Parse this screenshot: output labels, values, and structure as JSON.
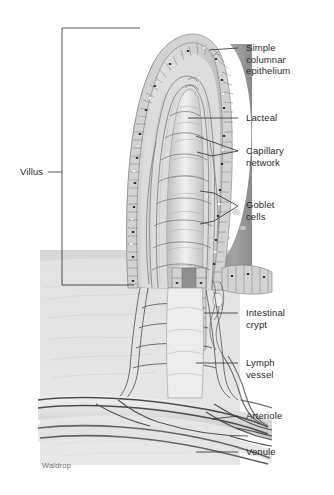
{
  "figure": {
    "signature": "Waldrop",
    "background_color": "#ffffff",
    "line_color": "#2b2b2b",
    "text_color": "#2b2b2b"
  },
  "palette": {
    "epithelium_light": "#d9d9d9",
    "epithelium_mid": "#bcbcbc",
    "lumen_gray": "#9a9a9a",
    "lamina_propria": "#cfcfcf",
    "goblet_dark": "#2a2a2a",
    "lacteal_white": "#f2f2f2",
    "vessel_dark": "#555555",
    "submucosa": "#dedede",
    "outline": "#4a4a4a"
  },
  "labels": [
    {
      "id": "villus",
      "text": "Villus",
      "x": 20,
      "y": 171,
      "leader": "bracket-left"
    },
    {
      "id": "simple-columnar-epithelium",
      "text": "Simple\ncolumnar\nepithelium",
      "x": 246,
      "y": 42,
      "leader": "line-right"
    },
    {
      "id": "lacteal",
      "text": "Lacteal",
      "x": 246,
      "y": 112,
      "leader": "line-right"
    },
    {
      "id": "capillary-network",
      "text": "Capillary\nnetwork",
      "x": 246,
      "y": 139,
      "leader": "line-right-forked"
    },
    {
      "id": "goblet-cells",
      "text": "Goblet\ncells",
      "x": 246,
      "y": 194,
      "leader": "line-right-forked"
    },
    {
      "id": "intestinal-crypt",
      "text": "Intestinal\ncrypt",
      "x": 246,
      "y": 307,
      "leader": "line-right"
    },
    {
      "id": "lymph-vessel",
      "text": "Lymph\nvessel",
      "x": 246,
      "y": 356,
      "leader": "line-right"
    },
    {
      "id": "arteriole",
      "text": "Arteriole",
      "x": 246,
      "y": 409,
      "leader": "line-right"
    },
    {
      "id": "venule",
      "text": "Venule",
      "x": 246,
      "y": 447,
      "leader": "line-right"
    }
  ],
  "structures": [
    {
      "id": "villus-body",
      "name": "Intestinal villus",
      "description": "Finger-like mucosal projection"
    },
    {
      "id": "epithelial-border",
      "name": "Simple columnar epithelium",
      "description": "Single layer of tall columnar cells lining the villus surface"
    },
    {
      "id": "lacteal-core",
      "name": "Lacteal",
      "description": "Central lymphatic capillary in villus core"
    },
    {
      "id": "capillary-net",
      "name": "Capillary network",
      "description": "Vascular plexus surrounding the lacteal"
    },
    {
      "id": "goblet-cell-dots",
      "name": "Goblet cells",
      "description": "Mucus-secreting cells scattered in epithelium"
    },
    {
      "id": "crypt-of-lieberkuhn",
      "name": "Intestinal crypt",
      "description": "Tubular gland invaginating into lamina propria"
    },
    {
      "id": "lymph-trunk",
      "name": "Lymph vessel",
      "description": "Submucosal lymphatic vessel"
    },
    {
      "id": "arteriole-vessel",
      "name": "Arteriole",
      "description": "Submucosal arteriole feeding the villus"
    },
    {
      "id": "venule-vessel",
      "name": "Venule",
      "description": "Submucosal venule draining the villus"
    }
  ]
}
